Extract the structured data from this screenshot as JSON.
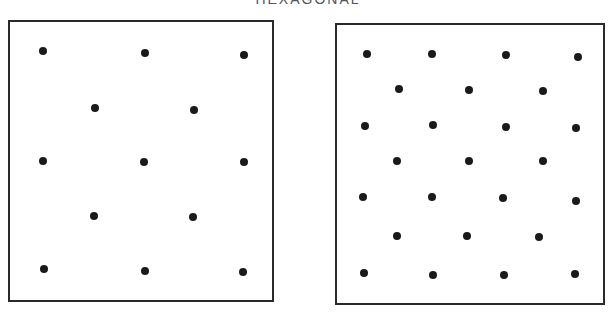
{
  "title": "HEXAGONAL",
  "panels": [
    {
      "name": "left-panel",
      "box": {
        "left": 8,
        "top": 20,
        "right": 274,
        "bottom": 302
      },
      "dots": [
        [
          43,
          51
        ],
        [
          145,
          53
        ],
        [
          244,
          55
        ],
        [
          95,
          108
        ],
        [
          194,
          110
        ],
        [
          43,
          161
        ],
        [
          144,
          162
        ],
        [
          244,
          162
        ],
        [
          94,
          216
        ],
        [
          193,
          217
        ],
        [
          44,
          269
        ],
        [
          145,
          271
        ],
        [
          243,
          272
        ]
      ]
    },
    {
      "name": "right-panel",
      "box": {
        "left": 335,
        "top": 23,
        "right": 605,
        "bottom": 305
      },
      "dots": [
        [
          367,
          54
        ],
        [
          432,
          54
        ],
        [
          506,
          55
        ],
        [
          578,
          57
        ],
        [
          399,
          89
        ],
        [
          469,
          90
        ],
        [
          543,
          91
        ],
        [
          365,
          126
        ],
        [
          433,
          125
        ],
        [
          506,
          127
        ],
        [
          576,
          128
        ],
        [
          397,
          161
        ],
        [
          469,
          161
        ],
        [
          543,
          161
        ],
        [
          363,
          197
        ],
        [
          432,
          197
        ],
        [
          503,
          198
        ],
        [
          576,
          201
        ],
        [
          397,
          236
        ],
        [
          467,
          236
        ],
        [
          539,
          237
        ],
        [
          364,
          273
        ],
        [
          433,
          275
        ],
        [
          504,
          275
        ],
        [
          575,
          274
        ]
      ]
    }
  ]
}
